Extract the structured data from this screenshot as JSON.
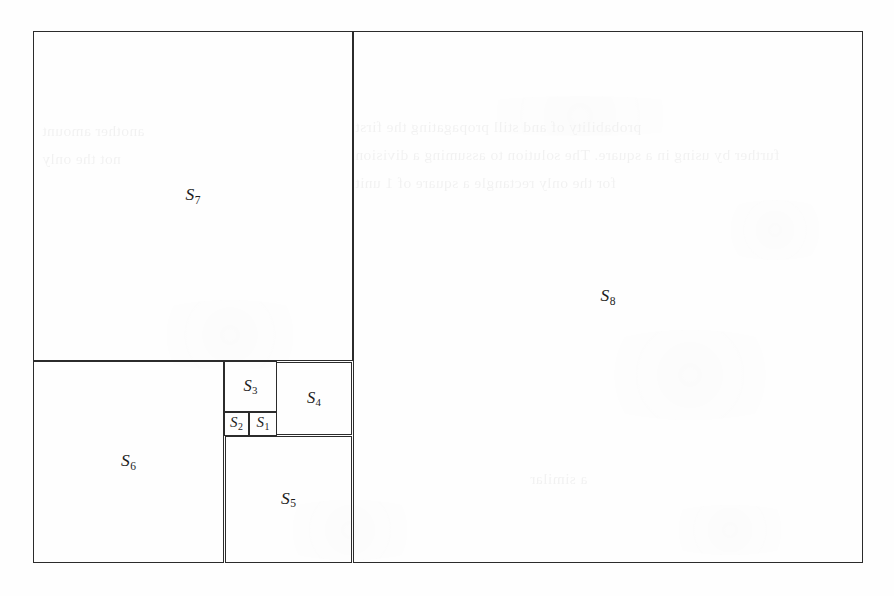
{
  "figure": {
    "kind": "squared-rectangle-dissection",
    "caption": "",
    "canvas": {
      "width": 894,
      "height": 596
    },
    "background_color": "#fefefe",
    "line_color": "#2b2b2b",
    "text_color": "#1d1d1d",
    "outer_rect": {
      "x": 33,
      "y": 31,
      "w": 830,
      "h": 532
    },
    "squares": [
      {
        "id": "S1",
        "letter": "S",
        "index": "1",
        "x": 249,
        "y": 412,
        "w": 28,
        "h": 24,
        "size_class": "tiny"
      },
      {
        "id": "S2",
        "letter": "S",
        "index": "2",
        "x": 224,
        "y": 412,
        "w": 25,
        "h": 24,
        "size_class": "tiny"
      },
      {
        "id": "S3",
        "letter": "S",
        "index": "3",
        "x": 224,
        "y": 361,
        "w": 53,
        "h": 51,
        "size_class": "small"
      },
      {
        "id": "S4",
        "letter": "S",
        "index": "4",
        "x": 276,
        "y": 362,
        "w": 76,
        "h": 73,
        "size_class": "small"
      },
      {
        "id": "S5",
        "letter": "S",
        "index": "5",
        "x": 225,
        "y": 436,
        "w": 127,
        "h": 127,
        "size_class": "normal"
      },
      {
        "id": "S6",
        "letter": "S",
        "index": "6",
        "x": 33,
        "y": 361,
        "w": 191,
        "h": 202,
        "size_class": "normal"
      },
      {
        "id": "S7",
        "letter": "S",
        "index": "7",
        "x": 33,
        "y": 31,
        "w": 320,
        "h": 330,
        "size_class": "normal"
      },
      {
        "id": "S8",
        "letter": "S",
        "index": "8",
        "x": 353,
        "y": 31,
        "w": 510,
        "h": 532,
        "size_class": "normal"
      }
    ],
    "bleed_through": {
      "note": "faint mirrored text showing through from the reverse of the page",
      "lines": [
        {
          "x": 355,
          "y": 118,
          "text": "probability of and still propagating the first"
        },
        {
          "x": 42,
          "y": 122,
          "text": "another amount"
        },
        {
          "x": 355,
          "y": 146,
          "text": "further by using in a square. The solution to assuming a division"
        },
        {
          "x": 42,
          "y": 150,
          "text": "not the only"
        },
        {
          "x": 355,
          "y": 174,
          "text": "for the only rectangle a square of 1 unit"
        },
        {
          "x": 530,
          "y": 470,
          "text": "a similar"
        }
      ],
      "blotches": [
        {
          "x": 430,
          "y": 96,
          "w": 300,
          "h": 40
        },
        {
          "x": 120,
          "y": 300,
          "w": 220,
          "h": 70
        },
        {
          "x": 560,
          "y": 330,
          "w": 260,
          "h": 90
        },
        {
          "x": 640,
          "y": 505,
          "w": 180,
          "h": 50
        },
        {
          "x": 250,
          "y": 500,
          "w": 200,
          "h": 60
        },
        {
          "x": 700,
          "y": 200,
          "w": 150,
          "h": 60
        }
      ]
    }
  }
}
